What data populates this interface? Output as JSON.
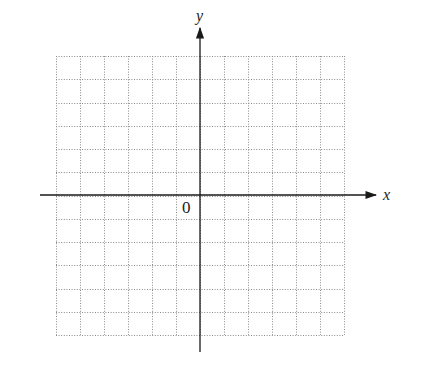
{
  "diagram": {
    "type": "coordinate-plane",
    "axes": {
      "x_label": "x",
      "y_label": "y",
      "origin_label": "0"
    },
    "grid": {
      "columns": 12,
      "rows": 12,
      "columns_left_of_origin": 6,
      "rows_above_origin": 6,
      "line_style": "dotted",
      "line_color": "#8a8a8a"
    },
    "colors": {
      "axis": "#1a1a1a",
      "background": "#ffffff"
    }
  }
}
